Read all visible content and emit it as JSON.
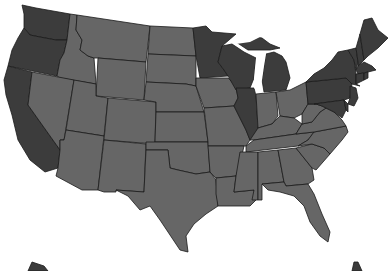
{
  "map": {
    "title": "United States",
    "colors": {
      "highlighted": "#3c3c3c",
      "other": "#666666",
      "border": "#1a1a1a",
      "background": "#ffffff"
    },
    "highlighted_states": [
      "WA",
      "OR",
      "CA",
      "MN",
      "WI",
      "MI",
      "IL",
      "NY",
      "PA",
      "NJ",
      "DE",
      "MD",
      "CT",
      "RI",
      "MA",
      "VT",
      "NH",
      "ME"
    ],
    "states": [
      {
        "id": "WA",
        "name": "Washington",
        "group": "highlighted"
      },
      {
        "id": "OR",
        "name": "Oregon",
        "group": "highlighted"
      },
      {
        "id": "CA",
        "name": "California",
        "group": "highlighted"
      },
      {
        "id": "ID",
        "name": "Idaho",
        "group": "other"
      },
      {
        "id": "NV",
        "name": "Nevada",
        "group": "other"
      },
      {
        "id": "MT",
        "name": "Montana",
        "group": "other"
      },
      {
        "id": "WY",
        "name": "Wyoming",
        "group": "other"
      },
      {
        "id": "UT",
        "name": "Utah",
        "group": "other"
      },
      {
        "id": "AZ",
        "name": "Arizona",
        "group": "other"
      },
      {
        "id": "CO",
        "name": "Colorado",
        "group": "other"
      },
      {
        "id": "NM",
        "name": "New Mexico",
        "group": "other"
      },
      {
        "id": "ND",
        "name": "North Dakota",
        "group": "other"
      },
      {
        "id": "SD",
        "name": "South Dakota",
        "group": "other"
      },
      {
        "id": "NE",
        "name": "Nebraska",
        "group": "other"
      },
      {
        "id": "KS",
        "name": "Kansas",
        "group": "other"
      },
      {
        "id": "OK",
        "name": "Oklahoma",
        "group": "other"
      },
      {
        "id": "TX",
        "name": "Texas",
        "group": "other"
      },
      {
        "id": "MN",
        "name": "Minnesota",
        "group": "highlighted"
      },
      {
        "id": "IA",
        "name": "Iowa",
        "group": "other"
      },
      {
        "id": "MO",
        "name": "Missouri",
        "group": "other"
      },
      {
        "id": "AR",
        "name": "Arkansas",
        "group": "other"
      },
      {
        "id": "LA",
        "name": "Louisiana",
        "group": "other"
      },
      {
        "id": "WI",
        "name": "Wisconsin",
        "group": "highlighted"
      },
      {
        "id": "IL",
        "name": "Illinois",
        "group": "highlighted"
      },
      {
        "id": "MI",
        "name": "Michigan",
        "group": "highlighted"
      },
      {
        "id": "IN",
        "name": "Indiana",
        "group": "other"
      },
      {
        "id": "OH",
        "name": "Ohio",
        "group": "other"
      },
      {
        "id": "KY",
        "name": "Kentucky",
        "group": "other"
      },
      {
        "id": "TN",
        "name": "Tennessee",
        "group": "other"
      },
      {
        "id": "MS",
        "name": "Mississippi",
        "group": "other"
      },
      {
        "id": "AL",
        "name": "Alabama",
        "group": "other"
      },
      {
        "id": "GA",
        "name": "Georgia",
        "group": "other"
      },
      {
        "id": "FL",
        "name": "Florida",
        "group": "other"
      },
      {
        "id": "SC",
        "name": "South Carolina",
        "group": "other"
      },
      {
        "id": "NC",
        "name": "North Carolina",
        "group": "other"
      },
      {
        "id": "VA",
        "name": "Virginia",
        "group": "other"
      },
      {
        "id": "WV",
        "name": "West Virginia",
        "group": "other"
      },
      {
        "id": "PA",
        "name": "Pennsylvania",
        "group": "highlighted"
      },
      {
        "id": "NY",
        "name": "New York",
        "group": "highlighted"
      },
      {
        "id": "NJ",
        "name": "New Jersey",
        "group": "highlighted"
      },
      {
        "id": "MD",
        "name": "Maryland",
        "group": "highlighted"
      },
      {
        "id": "DE",
        "name": "Delaware",
        "group": "highlighted"
      },
      {
        "id": "NE_region",
        "name": "New England",
        "group": "highlighted"
      },
      {
        "id": "AK",
        "name": "Alaska",
        "group": "highlighted"
      },
      {
        "id": "HI",
        "name": "Hawaii",
        "group": "highlighted"
      }
    ]
  }
}
